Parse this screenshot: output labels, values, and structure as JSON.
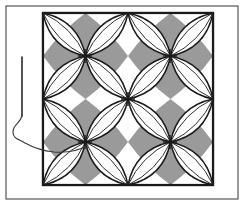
{
  "figure": {
    "title": "Quilting pattern diagram - orange peel / cathedral window block with hand sewing needle and thread",
    "canvas": {
      "width": 244,
      "height": 205,
      "background": "#ffffff"
    },
    "border_frame": {
      "name": "outer-border-frame",
      "x": 6,
      "y": 6,
      "width": 232,
      "height": 193,
      "stroke": "#555555",
      "stroke_width": 1.2,
      "fill": "none"
    },
    "quilt_block": {
      "name": "quilt-block-square",
      "x": 43,
      "y": 13,
      "width": 170,
      "height": 172,
      "fill": "#9a9a9a",
      "stroke": "#1a1a1a",
      "stroke_width": 2.2,
      "columns": 2,
      "rows": 2,
      "pattern_name": "orange-peel",
      "petal_fill": "#ffffff",
      "petal_stroke": "#1a1a1a",
      "petal_stroke_width": 1.5,
      "petal_inner_stroke_width": 0.9,
      "diamond_fill": "#ffffff"
    },
    "lattice_nodes": [
      {
        "x": 43,
        "y": 13
      },
      {
        "x": 128,
        "y": 13
      },
      {
        "x": 213,
        "y": 13
      },
      {
        "x": 85,
        "y": 56
      },
      {
        "x": 170,
        "y": 56
      },
      {
        "x": 43,
        "y": 99
      },
      {
        "x": 128,
        "y": 99
      },
      {
        "x": 213,
        "y": 99
      },
      {
        "x": 85,
        "y": 142
      },
      {
        "x": 170,
        "y": 142
      },
      {
        "x": 43,
        "y": 185
      },
      {
        "x": 128,
        "y": 185
      },
      {
        "x": 213,
        "y": 185
      }
    ],
    "stitch_marks": [
      {
        "x": 85,
        "y": 56,
        "length": 14
      },
      {
        "x": 170,
        "y": 56,
        "length": 14
      },
      {
        "x": 128,
        "y": 99,
        "length": 14
      },
      {
        "x": 85,
        "y": 142,
        "length": 14
      },
      {
        "x": 170,
        "y": 142,
        "length": 14
      }
    ],
    "needle": {
      "name": "sewing-needle",
      "tip_x": 22,
      "tip_y": 57,
      "eye_x": 22,
      "eye_y": 116,
      "stroke": "#2a2a2a",
      "stroke_width": 1.6
    },
    "thread": {
      "name": "thread-strand",
      "stroke": "#3a3a3a",
      "stroke_width": 1.1,
      "path": "M22,116 C20,124 13,124 13,132 C13,139 19,139 25,143 C34,148 44,151 54,152 C68,153 80,150 88,145"
    }
  }
}
